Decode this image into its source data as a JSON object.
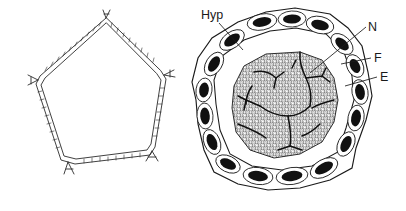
{
  "figure": {
    "background_color": "#ffffff",
    "ink_color": "#1a1a1a",
    "panels": [
      {
        "id": "left-panel",
        "name": "empty-pentagonal-cell-outline",
        "description": "Pentagonal cell wall outline with doubled hatched walls and forked corner junctions, lumen empty"
      },
      {
        "id": "right-panel",
        "name": "colonized-cell-cross-section",
        "description": "Pentagonal cross-section with ring of epidermal cells containing dark nuclei and a dense granular fungal mass with branching hyphae in the centre"
      }
    ],
    "labels": [
      {
        "id": "hyp",
        "text": "Hyp",
        "x": 201,
        "y": 19,
        "anchor": "start",
        "leader": [
          [
            219,
            23
          ],
          [
            243,
            50
          ]
        ]
      },
      {
        "id": "n",
        "text": "N",
        "x": 368,
        "y": 31,
        "anchor": "start",
        "leader": [
          [
            366,
            27
          ],
          [
            310,
            73
          ]
        ]
      },
      {
        "id": "f",
        "text": "F",
        "x": 374,
        "y": 62,
        "anchor": "start",
        "leader": [
          [
            371,
            58
          ],
          [
            341,
            64
          ]
        ]
      },
      {
        "id": "e",
        "text": "E",
        "x": 380,
        "y": 81,
        "anchor": "start",
        "leader": [
          [
            377,
            77
          ],
          [
            345,
            86
          ]
        ]
      }
    ],
    "legend_meaning": {
      "Hyp": "hypha",
      "N": "nucleus",
      "F": "fungus",
      "E": "epidermis"
    }
  }
}
